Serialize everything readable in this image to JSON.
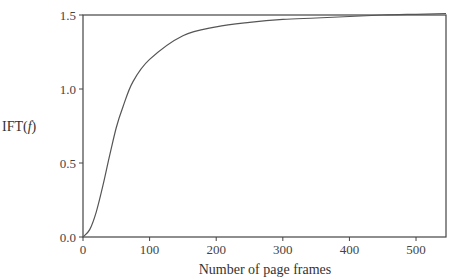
{
  "chart_data": {
    "type": "line",
    "title": "",
    "xlabel": "Number of page frames",
    "ylabel": "IFT(f)",
    "ylabel_parts": {
      "prefix": "IFT(",
      "var": "f",
      "suffix": ")"
    },
    "xlim": [
      0,
      545
    ],
    "ylim": [
      0,
      1.5
    ],
    "grid": false,
    "legend": null,
    "x_ticks": [
      0,
      100,
      200,
      300,
      400,
      500
    ],
    "x_tick_labels": [
      "0",
      "100",
      "200",
      "300",
      "400",
      "500"
    ],
    "y_ticks": [
      0.0,
      0.5,
      1.0,
      1.5
    ],
    "y_tick_labels": [
      "0.0",
      "0.5",
      "1.0",
      "1.5"
    ],
    "series": [
      {
        "name": "IFT(f)",
        "color": "#555555",
        "x": [
          0,
          10,
          20,
          30,
          40,
          50,
          60,
          75,
          100,
          150,
          200,
          250,
          300,
          350,
          400,
          450,
          500,
          545
        ],
        "y": [
          0.0,
          0.05,
          0.17,
          0.35,
          0.55,
          0.74,
          0.88,
          1.05,
          1.2,
          1.36,
          1.42,
          1.45,
          1.47,
          1.48,
          1.49,
          1.5,
          1.505,
          1.51
        ]
      }
    ]
  },
  "colors": {
    "axis": "#444444",
    "line": "#555555",
    "background": "#ffffff"
  }
}
